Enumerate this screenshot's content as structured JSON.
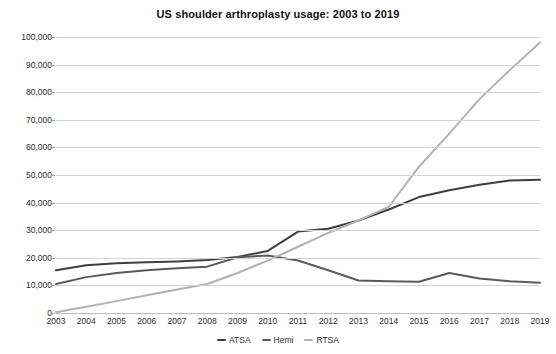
{
  "chart_data": {
    "type": "line",
    "title": "US shoulder arthroplasty usage: 2003 to 2019",
    "xlabel": "",
    "ylabel": "",
    "categories": [
      2003,
      2004,
      2005,
      2006,
      2007,
      2008,
      2009,
      2010,
      2011,
      2012,
      2013,
      2014,
      2015,
      2016,
      2017,
      2018,
      2019
    ],
    "x": [
      "2003",
      "2004",
      "2005",
      "2006",
      "2007",
      "2008",
      "2009",
      "2010",
      "2011",
      "2012",
      "2013",
      "2014",
      "2015",
      "2016",
      "2017",
      "2018",
      "2019"
    ],
    "ylim": [
      0,
      100000
    ],
    "yticks": [
      0,
      10000,
      20000,
      30000,
      40000,
      50000,
      60000,
      70000,
      80000,
      90000,
      100000
    ],
    "ytick_labels": [
      "0",
      "10,000",
      "20,000",
      "30,000",
      "40,000",
      "50,000",
      "60,000",
      "70,000",
      "80,000",
      "90,000",
      "100,000"
    ],
    "grid": true,
    "legend_position": "bottom",
    "series": [
      {
        "name": "ATSA",
        "color": "#3f3f3f",
        "values": [
          15500,
          17300,
          18000,
          18400,
          18700,
          19200,
          20300,
          22500,
          29500,
          30500,
          33500,
          37500,
          42000,
          44500,
          46500,
          48000,
          48300
        ]
      },
      {
        "name": "Hemi",
        "color": "#5a5a5a",
        "values": [
          10500,
          13000,
          14500,
          15500,
          16200,
          16800,
          20200,
          20800,
          19000,
          15500,
          11800,
          11500,
          11300,
          14500,
          12500,
          11500,
          11000
        ]
      },
      {
        "name": "RTSA",
        "color": "#b2b2b2",
        "values": [
          300,
          2300,
          4300,
          6400,
          8500,
          10500,
          14500,
          19000,
          24000,
          29000,
          33500,
          38500,
          53000,
          65000,
          77500,
          88000,
          98000
        ]
      }
    ]
  },
  "legend": {
    "items": [
      {
        "label": "ATSA",
        "color": "#3f3f3f"
      },
      {
        "label": "Hemi",
        "color": "#5a5a5a"
      },
      {
        "label": "RTSA",
        "color": "#b2b2b2"
      }
    ]
  }
}
